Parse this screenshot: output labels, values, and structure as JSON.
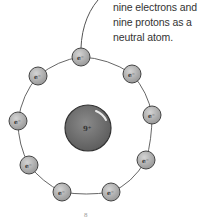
{
  "caption": {
    "lines": [
      "nine electrons and",
      "nine protons as a",
      "neutral atom."
    ]
  },
  "nucleus": {
    "label": "9⁺",
    "color": "#7a7a7a"
  },
  "electrons": {
    "label": "e⁻",
    "count": 9,
    "color": "#b8b8b8"
  },
  "page": {
    "number": "8"
  }
}
